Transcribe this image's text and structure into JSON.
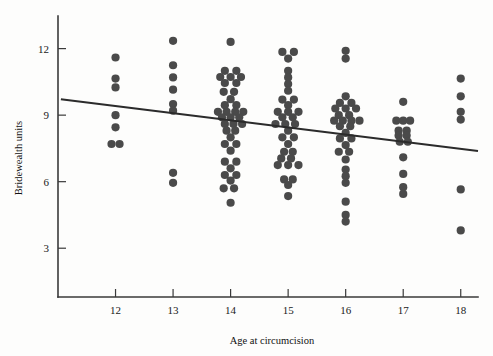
{
  "chart_data": {
    "type": "scatter",
    "title": "",
    "xlabel": "Age at circumcision",
    "ylabel": "Bridewealth units",
    "xlim": [
      11.0,
      18.3
    ],
    "ylim": [
      0.8,
      13.2
    ],
    "xticks": [
      12,
      13,
      14,
      15,
      16,
      17,
      18
    ],
    "xticklabels": [
      "12",
      "13",
      "14",
      "15",
      "16",
      "17",
      "18"
    ],
    "yticks": [
      3,
      6,
      9,
      12
    ],
    "yticklabels": [
      "3",
      "6",
      "9",
      "12"
    ],
    "grid": false,
    "legend": null,
    "marker_color": "#4a4a4a",
    "marker_size": 4.1,
    "axis_color": "#3a3a3a",
    "trend_line": {
      "label": "linear fit",
      "color": "#2b2b2b",
      "x": [
        11.05,
        18.3
      ],
      "y": [
        9.72,
        7.38
      ],
      "slope": -0.323,
      "intercept": 13.29
    },
    "series": [
      {
        "name": "Bridewealth by age",
        "points": [
          {
            "x": 12.0,
            "y": 11.6
          },
          {
            "x": 12.0,
            "y": 10.65
          },
          {
            "x": 12.0,
            "y": 10.25
          },
          {
            "x": 12.0,
            "y": 9.0
          },
          {
            "x": 12.0,
            "y": 8.45
          },
          {
            "x": 11.93,
            "y": 7.7
          },
          {
            "x": 12.07,
            "y": 7.7
          },
          {
            "x": 13.0,
            "y": 12.35
          },
          {
            "x": 13.0,
            "y": 11.25
          },
          {
            "x": 13.0,
            "y": 10.7
          },
          {
            "x": 13.0,
            "y": 10.15
          },
          {
            "x": 13.0,
            "y": 9.5
          },
          {
            "x": 13.0,
            "y": 9.2
          },
          {
            "x": 13.0,
            "y": 6.4
          },
          {
            "x": 13.0,
            "y": 5.95
          },
          {
            "x": 14.0,
            "y": 12.3
          },
          {
            "x": 13.9,
            "y": 11.0
          },
          {
            "x": 14.1,
            "y": 11.0
          },
          {
            "x": 13.82,
            "y": 10.72
          },
          {
            "x": 14.0,
            "y": 10.72
          },
          {
            "x": 14.18,
            "y": 10.72
          },
          {
            "x": 13.9,
            "y": 10.45
          },
          {
            "x": 14.1,
            "y": 10.45
          },
          {
            "x": 13.88,
            "y": 10.05
          },
          {
            "x": 14.06,
            "y": 10.05
          },
          {
            "x": 14.0,
            "y": 9.72
          },
          {
            "x": 13.9,
            "y": 9.45
          },
          {
            "x": 14.1,
            "y": 9.45
          },
          {
            "x": 13.78,
            "y": 9.15
          },
          {
            "x": 13.93,
            "y": 9.15
          },
          {
            "x": 14.08,
            "y": 9.15
          },
          {
            "x": 14.22,
            "y": 9.15
          },
          {
            "x": 13.85,
            "y": 8.9
          },
          {
            "x": 14.0,
            "y": 8.9
          },
          {
            "x": 14.15,
            "y": 8.9
          },
          {
            "x": 13.9,
            "y": 8.6
          },
          {
            "x": 14.05,
            "y": 8.6
          },
          {
            "x": 14.2,
            "y": 8.6
          },
          {
            "x": 13.93,
            "y": 8.3
          },
          {
            "x": 14.08,
            "y": 8.3
          },
          {
            "x": 14.0,
            "y": 8.0
          },
          {
            "x": 13.9,
            "y": 7.7
          },
          {
            "x": 14.1,
            "y": 7.7
          },
          {
            "x": 14.0,
            "y": 7.4
          },
          {
            "x": 13.9,
            "y": 6.9
          },
          {
            "x": 14.1,
            "y": 6.9
          },
          {
            "x": 14.0,
            "y": 6.6
          },
          {
            "x": 13.9,
            "y": 6.3
          },
          {
            "x": 14.1,
            "y": 6.3
          },
          {
            "x": 14.0,
            "y": 6.05
          },
          {
            "x": 13.88,
            "y": 5.7
          },
          {
            "x": 14.06,
            "y": 5.7
          },
          {
            "x": 14.0,
            "y": 5.05
          },
          {
            "x": 14.9,
            "y": 11.85
          },
          {
            "x": 15.1,
            "y": 11.85
          },
          {
            "x": 15.0,
            "y": 11.55
          },
          {
            "x": 15.0,
            "y": 11.0
          },
          {
            "x": 15.0,
            "y": 10.7
          },
          {
            "x": 15.0,
            "y": 10.4
          },
          {
            "x": 15.0,
            "y": 10.1
          },
          {
            "x": 14.9,
            "y": 9.7
          },
          {
            "x": 15.1,
            "y": 9.7
          },
          {
            "x": 15.0,
            "y": 9.45
          },
          {
            "x": 14.82,
            "y": 9.15
          },
          {
            "x": 15.0,
            "y": 9.15
          },
          {
            "x": 15.18,
            "y": 9.15
          },
          {
            "x": 14.9,
            "y": 8.9
          },
          {
            "x": 15.08,
            "y": 8.9
          },
          {
            "x": 14.78,
            "y": 8.6
          },
          {
            "x": 14.95,
            "y": 8.6
          },
          {
            "x": 15.12,
            "y": 8.6
          },
          {
            "x": 15.0,
            "y": 8.3
          },
          {
            "x": 14.9,
            "y": 8.0
          },
          {
            "x": 15.1,
            "y": 8.0
          },
          {
            "x": 15.0,
            "y": 7.7
          },
          {
            "x": 14.93,
            "y": 7.35
          },
          {
            "x": 15.08,
            "y": 7.35
          },
          {
            "x": 14.88,
            "y": 7.05
          },
          {
            "x": 15.05,
            "y": 7.05
          },
          {
            "x": 14.82,
            "y": 6.75
          },
          {
            "x": 15.0,
            "y": 6.75
          },
          {
            "x": 15.18,
            "y": 6.75
          },
          {
            "x": 14.93,
            "y": 6.1
          },
          {
            "x": 15.08,
            "y": 6.1
          },
          {
            "x": 15.0,
            "y": 5.85
          },
          {
            "x": 15.0,
            "y": 5.35
          },
          {
            "x": 16.0,
            "y": 11.9
          },
          {
            "x": 16.0,
            "y": 11.55
          },
          {
            "x": 16.0,
            "y": 9.85
          },
          {
            "x": 15.9,
            "y": 9.55
          },
          {
            "x": 16.1,
            "y": 9.55
          },
          {
            "x": 15.82,
            "y": 9.3
          },
          {
            "x": 16.0,
            "y": 9.3
          },
          {
            "x": 16.18,
            "y": 9.3
          },
          {
            "x": 15.88,
            "y": 9.0
          },
          {
            "x": 16.06,
            "y": 9.0
          },
          {
            "x": 15.8,
            "y": 8.75
          },
          {
            "x": 15.95,
            "y": 8.75
          },
          {
            "x": 16.1,
            "y": 8.75
          },
          {
            "x": 16.24,
            "y": 8.75
          },
          {
            "x": 15.9,
            "y": 8.5
          },
          {
            "x": 16.08,
            "y": 8.5
          },
          {
            "x": 16.0,
            "y": 8.2
          },
          {
            "x": 15.9,
            "y": 7.95
          },
          {
            "x": 16.1,
            "y": 7.95
          },
          {
            "x": 16.0,
            "y": 7.65
          },
          {
            "x": 15.88,
            "y": 7.35
          },
          {
            "x": 16.06,
            "y": 7.35
          },
          {
            "x": 16.0,
            "y": 7.0
          },
          {
            "x": 16.0,
            "y": 6.55
          },
          {
            "x": 16.0,
            "y": 6.25
          },
          {
            "x": 16.0,
            "y": 5.95
          },
          {
            "x": 16.0,
            "y": 5.1
          },
          {
            "x": 16.0,
            "y": 4.5
          },
          {
            "x": 16.0,
            "y": 4.2
          },
          {
            "x": 17.0,
            "y": 9.6
          },
          {
            "x": 16.88,
            "y": 8.75
          },
          {
            "x": 17.0,
            "y": 8.75
          },
          {
            "x": 17.12,
            "y": 8.75
          },
          {
            "x": 16.92,
            "y": 8.3
          },
          {
            "x": 17.06,
            "y": 8.3
          },
          {
            "x": 16.92,
            "y": 8.08
          },
          {
            "x": 17.06,
            "y": 8.08
          },
          {
            "x": 16.94,
            "y": 7.8
          },
          {
            "x": 17.08,
            "y": 7.8
          },
          {
            "x": 17.0,
            "y": 7.1
          },
          {
            "x": 17.0,
            "y": 6.35
          },
          {
            "x": 17.0,
            "y": 5.75
          },
          {
            "x": 17.0,
            "y": 5.45
          },
          {
            "x": 18.0,
            "y": 10.65
          },
          {
            "x": 18.0,
            "y": 9.85
          },
          {
            "x": 18.0,
            "y": 9.15
          },
          {
            "x": 18.0,
            "y": 8.8
          },
          {
            "x": 18.0,
            "y": 5.65
          },
          {
            "x": 18.0,
            "y": 3.8
          }
        ]
      }
    ]
  }
}
